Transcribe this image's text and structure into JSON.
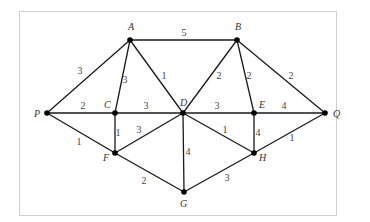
{
  "diagram": {
    "type": "weighted-undirected-graph",
    "frame": {
      "x": 19,
      "y": 11,
      "width": 317,
      "height": 204,
      "border_color": "#cfcfcf"
    },
    "colors": {
      "edge": "#1a1a1a",
      "node": "#000000",
      "label": "#333333",
      "weight": "#444444"
    },
    "nodes": [
      {
        "id": "A",
        "label": "A",
        "x": 130,
        "y": 40,
        "lx": 128,
        "ly": 30
      },
      {
        "id": "B",
        "label": "B",
        "x": 237,
        "y": 40,
        "lx": 235,
        "ly": 30
      },
      {
        "id": "P",
        "label": "P",
        "x": 47,
        "y": 113,
        "lx": 34,
        "ly": 117
      },
      {
        "id": "C",
        "label": "C",
        "x": 115,
        "y": 113,
        "lx": 104,
        "ly": 108
      },
      {
        "id": "D",
        "label": "D",
        "x": 183,
        "y": 113,
        "lx": 180,
        "ly": 106
      },
      {
        "id": "E",
        "label": "E",
        "x": 254,
        "y": 113,
        "lx": 259,
        "ly": 108
      },
      {
        "id": "Q",
        "label": "Q",
        "x": 325,
        "y": 113,
        "lx": 333,
        "ly": 117
      },
      {
        "id": "F",
        "label": "F",
        "x": 115,
        "y": 153,
        "lx": 103,
        "ly": 161
      },
      {
        "id": "H",
        "label": "H",
        "x": 254,
        "y": 153,
        "lx": 259,
        "ly": 161
      },
      {
        "id": "G",
        "label": "G",
        "x": 184,
        "y": 192,
        "lx": 180,
        "ly": 207
      }
    ],
    "edges": [
      {
        "from": "A",
        "to": "B",
        "weight": "5",
        "wx": 184,
        "wy": 36
      },
      {
        "from": "A",
        "to": "P",
        "weight": "3",
        "wx": 80,
        "wy": 74
      },
      {
        "from": "A",
        "to": "C",
        "weight": "3",
        "wx": 125,
        "wy": 83
      },
      {
        "from": "A",
        "to": "D",
        "weight": "1",
        "wx": 164,
        "wy": 79
      },
      {
        "from": "B",
        "to": "D",
        "weight": "2",
        "wx": 219,
        "wy": 79
      },
      {
        "from": "B",
        "to": "E",
        "weight": "2",
        "wx": 249,
        "wy": 79
      },
      {
        "from": "B",
        "to": "Q",
        "weight": "2",
        "wx": 291,
        "wy": 79
      },
      {
        "from": "P",
        "to": "C",
        "weight": "2",
        "wx": 83,
        "wy": 109
      },
      {
        "from": "C",
        "to": "D",
        "weight": "3",
        "wx": 146,
        "wy": 109
      },
      {
        "from": "D",
        "to": "E",
        "weight": "3",
        "wx": 217,
        "wy": 109
      },
      {
        "from": "E",
        "to": "Q",
        "weight": "4",
        "wx": 284,
        "wy": 109
      },
      {
        "from": "P",
        "to": "F",
        "weight": "1",
        "wx": 79,
        "wy": 145
      },
      {
        "from": "C",
        "to": "F",
        "weight": "1",
        "wx": 118,
        "wy": 136
      },
      {
        "from": "F",
        "to": "D",
        "weight": "3",
        "wx": 139,
        "wy": 133
      },
      {
        "from": "D",
        "to": "G",
        "weight": "4",
        "wx": 188,
        "wy": 155
      },
      {
        "from": "D",
        "to": "H",
        "weight": "1",
        "wx": 225,
        "wy": 133
      },
      {
        "from": "E",
        "to": "H",
        "weight": "4",
        "wx": 258,
        "wy": 136
      },
      {
        "from": "Q",
        "to": "H",
        "weight": "1",
        "wx": 292,
        "wy": 141
      },
      {
        "from": "F",
        "to": "G",
        "weight": "2",
        "wx": 144,
        "wy": 184
      },
      {
        "from": "G",
        "to": "H",
        "weight": "3",
        "wx": 227,
        "wy": 181
      }
    ]
  }
}
